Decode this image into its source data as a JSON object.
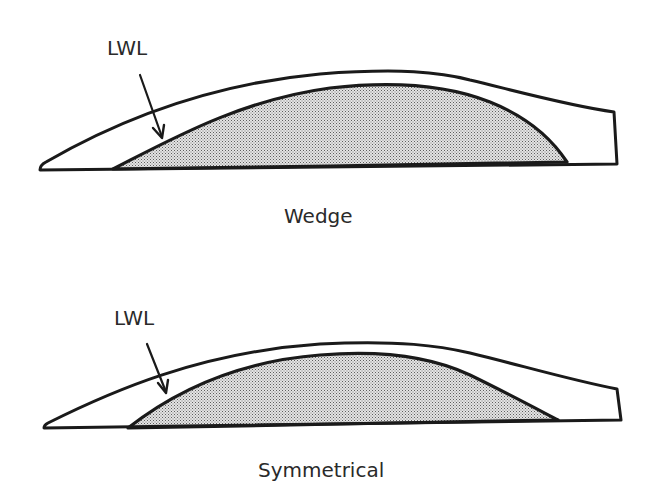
{
  "diagrams": [
    {
      "id": "wedge",
      "pointer_label": "LWL",
      "caption": "Wedge",
      "pointer_icon": "arrow-down-icon"
    },
    {
      "id": "symmetrical",
      "pointer_label": "LWL",
      "caption": "Symmetrical",
      "pointer_icon": "arrow-down-icon"
    }
  ],
  "colors": {
    "line": "#1a1a1a",
    "text": "#2a2a2a",
    "hatch_dark": "#6e6e6e",
    "hatch_light": "#dcdcdc",
    "background": "#ffffff"
  }
}
